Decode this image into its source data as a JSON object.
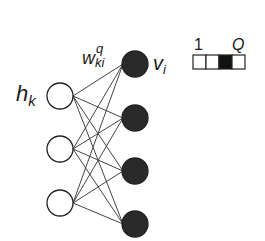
{
  "diagram": {
    "type": "bipartite-network (RBM)",
    "hidden_layer": {
      "label": "h",
      "label_subscript": "k",
      "node_count": 3,
      "node_style": "open-circle",
      "nodes": [
        {
          "cx": 60,
          "cy": 96
        },
        {
          "cx": 60,
          "cy": 149
        },
        {
          "cx": 60,
          "cy": 203
        }
      ]
    },
    "visible_layer": {
      "label": "v",
      "label_subscript": "i",
      "node_count": 4,
      "node_style": "filled-circle",
      "nodes": [
        {
          "cx": 135,
          "cy": 64
        },
        {
          "cx": 135,
          "cy": 118
        },
        {
          "cx": 135,
          "cy": 171
        },
        {
          "cx": 135,
          "cy": 224
        }
      ]
    },
    "weight_label": {
      "base": "w",
      "superscript": "q",
      "subscript": "ki"
    },
    "connectivity": "fully-connected",
    "one_hot_legend": {
      "start_label": "1",
      "end_label": "Q",
      "cell_count": 4,
      "active_index": 2
    },
    "colors": {
      "line": "#444444",
      "filled_node": "#2a2a2a",
      "open_node_fill": "#ffffff",
      "stroke": "#222222"
    }
  }
}
